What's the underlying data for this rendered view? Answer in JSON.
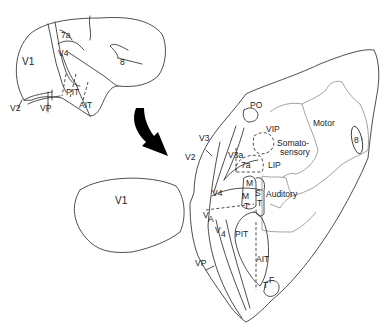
{
  "figure": {
    "arrow": "curved-arrow-black"
  },
  "lateral_view": {
    "labels": {
      "v1": "V1",
      "v2": "V2",
      "vp": "VP",
      "v4": "V4",
      "a7": "7a",
      "pit": "PIT",
      "ait": "AIT",
      "f8": "8"
    }
  },
  "v1_separate": {
    "label": "V1"
  },
  "flat_map": {
    "labels": {
      "po": "PO",
      "vip": "VIP",
      "motor": "Motor",
      "f8": "8",
      "v3": "V3",
      "v2": "V2",
      "v3a": "V3a",
      "somato1": "Somato-",
      "somato2": "sensory",
      "a7": "7a",
      "lip": "LIP",
      "v4": "V4",
      "m": "M",
      "mt_m": "M",
      "mt_t": "T",
      "s": "S",
      "mst_t": "T",
      "auditory": "Auditory",
      "va": "V",
      "va_sub": "A",
      "v4b": "V",
      "v4b_sub": "4",
      "pit": "PIT",
      "vp": "VP",
      "ait": "AIT",
      "tf_t": "T",
      "tf_f": "F"
    }
  }
}
